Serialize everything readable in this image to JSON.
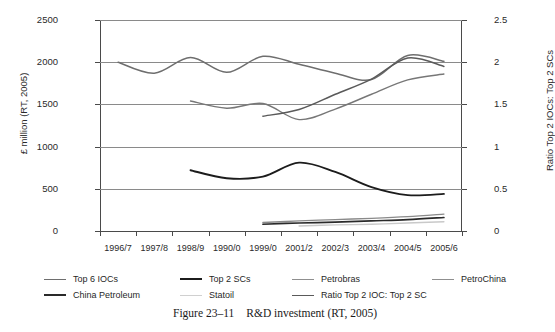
{
  "caption": {
    "figure_number": "Figure 23–11",
    "text": "R&D investment (RT, 2005)"
  },
  "chart_data": {
    "type": "line",
    "title": "",
    "xlabel": "",
    "ylabel": "£ million (RT, 2005)",
    "ylabel_right": "Ratio Top 2 IOCs: Top 2 SCs",
    "categories": [
      "1996/7",
      "1997/8",
      "1998/9",
      "1990/0",
      "1999/0",
      "2001/2",
      "2002/3",
      "2003/4",
      "2004/5",
      "2005/6"
    ],
    "ylim": [
      0,
      2500
    ],
    "yticks": [
      0,
      500,
      1000,
      1500,
      2000,
      2500
    ],
    "ylim_right": [
      0,
      2.5
    ],
    "yticks_right": [
      0,
      0.5,
      1,
      1.5,
      2,
      2.5
    ],
    "grid": true,
    "legend_position": "bottom",
    "series": [
      {
        "name": "Top 6 IOCs",
        "axis": "left",
        "color": "#6e6e6e",
        "width": 1.5,
        "values": [
          2000,
          1870,
          2055,
          1880,
          2070,
          1975,
          1870,
          1795,
          2080,
          2010
        ]
      },
      {
        "name": "Top 2 SCs",
        "axis": "left",
        "color": "#1c1c1c",
        "width": 1.9,
        "values": [
          null,
          null,
          720,
          625,
          645,
          810,
          700,
          520,
          425,
          440
        ]
      },
      {
        "name": "Petrobras",
        "axis": "left",
        "color": "#777777",
        "width": 1.4,
        "values": [
          null,
          null,
          1540,
          1455,
          1510,
          1320,
          1445,
          1620,
          1790,
          1860
        ]
      },
      {
        "name": "PetroChina",
        "axis": "left",
        "color": "#8a8a8a",
        "width": 1.4,
        "values": [
          null,
          null,
          null,
          null,
          100,
          120,
          135,
          150,
          170,
          200
        ]
      },
      {
        "name": "China Petroleum",
        "axis": "left",
        "color": "#2a2a2a",
        "width": 1.7,
        "values": [
          null,
          null,
          null,
          null,
          80,
          95,
          105,
          120,
          135,
          160
        ]
      },
      {
        "name": "Statoil",
        "axis": "left",
        "color": "#c9c9c9",
        "width": 1.4,
        "values": [
          null,
          null,
          null,
          null,
          null,
          60,
          72,
          80,
          95,
          110
        ]
      },
      {
        "name": "Ratio Top 2 IOC: Top 2 SC",
        "axis": "right",
        "color": "#5a5a5a",
        "width": 1.5,
        "values": [
          null,
          null,
          null,
          null,
          1.36,
          1.44,
          1.62,
          1.8,
          2.05,
          1.95
        ]
      }
    ]
  },
  "legend": {
    "items": [
      {
        "label": "Top 6 IOCs",
        "color": "#6e6e6e",
        "width": 1.6
      },
      {
        "label": "Top 2 SCs",
        "color": "#1c1c1c",
        "width": 2.2
      },
      {
        "label": "Petrobras",
        "color": "#8f8f8f",
        "width": 1.6
      },
      {
        "label": "PetroChina",
        "color": "#8f8f8f",
        "width": 1.6
      },
      {
        "label": "China Petroleum",
        "color": "#2a2a2a",
        "width": 2.2
      },
      {
        "label": "Statoil",
        "color": "#d0d0d0",
        "width": 1.6
      },
      {
        "label": "Ratio Top 2 IOC: Top 2 SC",
        "color": "#5a5a5a",
        "width": 1.8
      }
    ]
  }
}
